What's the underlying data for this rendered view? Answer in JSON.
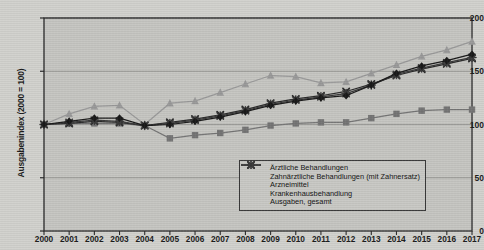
{
  "chart_data": {
    "type": "line",
    "title": "",
    "xlabel": "",
    "ylabel": "Ausgabenindex (2000 = 100)",
    "ylim": [
      0,
      200
    ],
    "yticks": [
      0,
      50,
      100,
      150,
      200
    ],
    "grid": true,
    "legend_position": "bottom-right",
    "categories": [
      "2000",
      "2001",
      "2002",
      "2003",
      "2004",
      "2005",
      "2006",
      "2007",
      "2008",
      "2009",
      "2010",
      "2011",
      "2012",
      "2013",
      "2014",
      "2015",
      "2016",
      "2017"
    ],
    "series": [
      {
        "name": "Ärztliche Behandlungen",
        "marker": "diamond",
        "color": "#1a1a1a",
        "values": [
          100,
          103,
          106,
          106,
          99,
          100,
          103,
          107,
          112,
          118,
          122,
          125,
          127,
          137,
          148,
          155,
          160,
          166
        ]
      },
      {
        "name": "Zahnärztliche Behandlungen (mit Zahnersatz)",
        "marker": "square",
        "color": "#757575",
        "values": [
          100,
          101,
          101,
          101,
          99,
          87,
          90,
          92,
          95,
          99,
          101,
          102,
          102,
          106,
          110,
          113,
          114,
          114
        ]
      },
      {
        "name": "Arzneimittel",
        "marker": "triangle",
        "color": "#9a9a9a",
        "values": [
          100,
          110,
          117,
          118,
          100,
          120,
          122,
          130,
          138,
          146,
          145,
          139,
          140,
          148,
          156,
          164,
          170,
          178
        ]
      },
      {
        "name": "Krankenhausbehandlung",
        "marker": "cross",
        "color": "#2a2a2a",
        "values": [
          100,
          101,
          103,
          102,
          99,
          102,
          105,
          109,
          114,
          120,
          124,
          127,
          131,
          138,
          146,
          152,
          157,
          162
        ]
      },
      {
        "name": "Ausgaben, gesamt",
        "marker": "asterisk",
        "color": "#3a3a3a",
        "values": [
          100,
          102,
          104,
          103,
          99,
          101,
          104,
          108,
          113,
          119,
          123,
          126,
          129,
          137,
          147,
          153,
          158,
          163
        ]
      }
    ]
  },
  "legend": {
    "items": [
      {
        "label": "Ärztliche Behandlungen",
        "marker": "diamond"
      },
      {
        "label": "Zahnärztliche Behandlungen (mit Zahnersatz)",
        "marker": "square"
      },
      {
        "label": "Arzneimittel",
        "marker": "triangle"
      },
      {
        "label": "Krankenhausbehandlung",
        "marker": "cross"
      },
      {
        "label": "Ausgaben, gesamt",
        "marker": "asterisk"
      }
    ]
  },
  "colors": {
    "plot_background": "#c6c6c2",
    "page_background": "#d2d2ce",
    "axis": "#2b2b2b",
    "grid": "#8e8e8a"
  }
}
